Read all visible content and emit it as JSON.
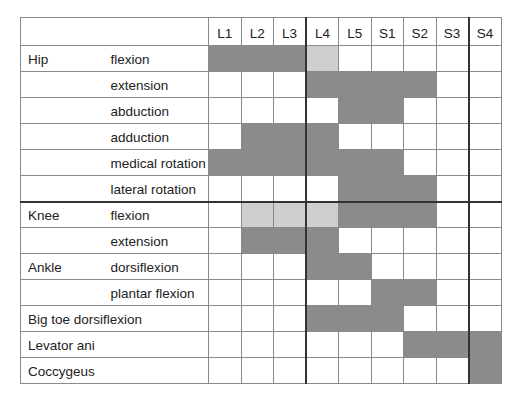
{
  "table": {
    "columns": [
      "L1",
      "L2",
      "L3",
      "L4",
      "L5",
      "S1",
      "S2",
      "S3",
      "S4"
    ],
    "shade_legend": {
      "dark": "#8b8b8b",
      "light": "#cfcfcf",
      "none": "#ffffff"
    },
    "rows": [
      {
        "region": "Hip",
        "movement": "flexion",
        "cells": [
          "dark",
          "dark",
          "dark",
          "light",
          "",
          "",
          "",
          "",
          ""
        ]
      },
      {
        "region": "",
        "movement": "extension",
        "cells": [
          "",
          "",
          "",
          "dark",
          "dark",
          "dark",
          "dark",
          "",
          ""
        ]
      },
      {
        "region": "",
        "movement": "abduction",
        "cells": [
          "",
          "",
          "",
          "",
          "dark",
          "dark",
          "",
          "",
          ""
        ]
      },
      {
        "region": "",
        "movement": "adduction",
        "cells": [
          "",
          "dark",
          "dark",
          "dark",
          "",
          "",
          "",
          "",
          ""
        ]
      },
      {
        "region": "",
        "movement": "medical rotation",
        "cells": [
          "dark",
          "dark",
          "dark",
          "dark",
          "dark",
          "dark",
          "",
          "",
          ""
        ]
      },
      {
        "region": "",
        "movement": "lateral rotation",
        "cells": [
          "",
          "",
          "",
          "",
          "dark",
          "dark",
          "dark",
          "",
          ""
        ]
      },
      {
        "region": "Knee",
        "movement": "flexion",
        "cells": [
          "",
          "light",
          "light",
          "light",
          "dark",
          "dark",
          "dark",
          "",
          ""
        ],
        "thick_top": true
      },
      {
        "region": "",
        "movement": "extension",
        "cells": [
          "",
          "dark",
          "dark",
          "dark",
          "",
          "",
          "",
          "",
          ""
        ]
      },
      {
        "region": "Ankle",
        "movement": "dorsiflexion",
        "cells": [
          "",
          "",
          "",
          "dark",
          "dark",
          "",
          "",
          "",
          ""
        ]
      },
      {
        "region": "",
        "movement": "plantar flexion",
        "cells": [
          "",
          "",
          "",
          "",
          "",
          "dark",
          "dark",
          "",
          ""
        ]
      },
      {
        "region": "Big toe dorsiflexion",
        "movement": null,
        "cells": [
          "",
          "",
          "",
          "dark",
          "dark",
          "dark",
          "",
          "",
          ""
        ]
      },
      {
        "region": "Levator ani",
        "movement": null,
        "cells": [
          "",
          "",
          "",
          "",
          "",
          "",
          "dark",
          "dark",
          "dark"
        ]
      },
      {
        "region": "Coccygeus",
        "movement": null,
        "cells": [
          "",
          "",
          "",
          "",
          "",
          "",
          "",
          "",
          "dark"
        ]
      }
    ]
  }
}
